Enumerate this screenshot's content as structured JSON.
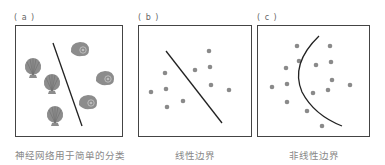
{
  "panels": [
    {
      "id": "a",
      "label": "( a )",
      "caption": "神经网络用于简单的分类"
    },
    {
      "id": "b",
      "label": "( b )",
      "caption": "线性边界"
    },
    {
      "id": "c",
      "label": "( c )",
      "caption": "非线性边界"
    }
  ],
  "colors": {
    "dot": "#8a8a8a",
    "line": "#222222",
    "frame": "#444444",
    "shell": "#8c8c8c"
  }
}
